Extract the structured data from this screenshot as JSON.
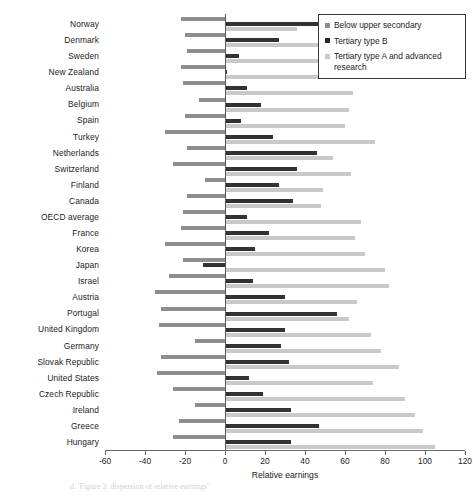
{
  "chart_data": {
    "type": "bar",
    "orientation": "horizontal",
    "title": "",
    "xlabel": "Relative earnings",
    "ylabel": "",
    "xlim": [
      -60,
      120
    ],
    "xticks": [
      -60,
      -40,
      -20,
      0,
      20,
      40,
      60,
      80,
      100,
      120
    ],
    "xticklabels": [
      "-60",
      "-40",
      "-20",
      "0",
      "20",
      "40",
      "60",
      "80",
      "100",
      "120"
    ],
    "grid": false,
    "legend_position": "top-right",
    "categories": [
      "Norway",
      "Denmark",
      "Sweden",
      "New Zealand",
      "Australia",
      "Belgium",
      "Spain",
      "Turkey",
      "Netherlands",
      "Switzerland",
      "Finland",
      "Canada",
      "OECD average",
      "France",
      "Korea",
      "Japan",
      "Israel",
      "Austria",
      "Portugal",
      "United Kingdom",
      "Germany",
      "Slovak Republic",
      "United States",
      "Czech Republic",
      "Ireland",
      "Greece",
      "Hungary"
    ],
    "series": [
      {
        "name": "Below upper secondary",
        "color": "#8e8e8e",
        "values": [
          -22,
          -20,
          -19,
          -22,
          -21,
          -13,
          -20,
          -30,
          -19,
          -26,
          -10,
          -19,
          -21,
          -22,
          -30,
          -21,
          -28,
          -35,
          -32,
          -33,
          -15,
          -32,
          -34,
          -26,
          -15,
          -23,
          -26
        ]
      },
      {
        "name": "Tertiary type B",
        "color": "#333333",
        "values": [
          47,
          27,
          7,
          1,
          11,
          18,
          8,
          24,
          46,
          36,
          27,
          34,
          11,
          22,
          15,
          -11,
          14,
          30,
          56,
          30,
          28,
          32,
          12,
          19,
          33,
          47,
          33
        ]
      },
      {
        "name": "Tertiary type A and advanced research",
        "color": "#c9c9c9",
        "values": [
          36,
          55,
          56,
          59,
          64,
          62,
          60,
          75,
          54,
          63,
          49,
          48,
          68,
          65,
          70,
          80,
          82,
          66,
          62,
          73,
          78,
          87,
          74,
          90,
          95,
          99,
          105
        ]
      }
    ]
  },
  "legend": {
    "items": [
      {
        "label": "Below upper secondary",
        "swatch": "s0"
      },
      {
        "label": "Tertiary type B",
        "swatch": "s1"
      },
      {
        "label": "Tertiary type A and advanced research",
        "swatch": "s2"
      }
    ]
  },
  "axis": {
    "x_title": "Relative earnings"
  },
  "background_text": {
    "caption_fragment": "d. 'Figure 3: dispersion of relative earnings'"
  }
}
